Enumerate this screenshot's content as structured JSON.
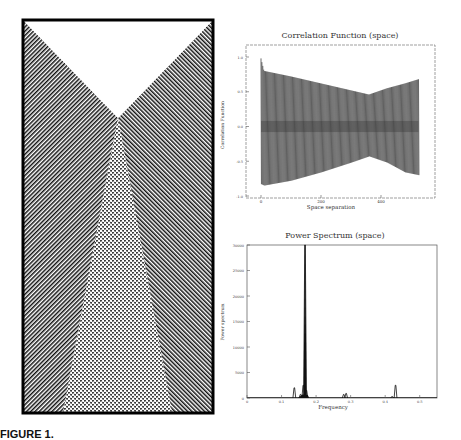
{
  "figure": {
    "caption": "FIGURE 1.",
    "pattern_panel": {
      "description": "Space-time pattern of cellular automaton: diagonal stripes from two sides colliding in a V, with a dotted interference region below the apex"
    }
  },
  "chart_data": [
    {
      "type": "line",
      "title": "Correlation Function (space)",
      "xlabel": "Space separation",
      "ylabel": "Correlation Function",
      "xlim": [
        0,
        580
      ],
      "ylim": [
        -1.0,
        1.0
      ],
      "xticks": [
        "0",
        "200",
        "400"
      ],
      "xtick_values": [
        0,
        200,
        400
      ],
      "yticks": [
        "-1.0",
        "-0.5",
        "0.0",
        "0.5",
        "1.0"
      ],
      "ytick_values": [
        -1.0,
        -0.5,
        0.0,
        0.5,
        1.0
      ],
      "grid": false,
      "series": [
        {
          "name": "correlation",
          "oscillation_period": 6,
          "x_range": [
            0,
            525
          ],
          "envelope_upper": [
            [
              0,
              0.98
            ],
            [
              10,
              0.8
            ],
            [
              100,
              0.72
            ],
            [
              200,
              0.62
            ],
            [
              300,
              0.52
            ],
            [
              360,
              0.46
            ],
            [
              420,
              0.55
            ],
            [
              480,
              0.62
            ],
            [
              525,
              0.68
            ]
          ],
          "envelope_lower": [
            [
              0,
              -0.83
            ],
            [
              10,
              -0.85
            ],
            [
              100,
              -0.78
            ],
            [
              200,
              -0.66
            ],
            [
              300,
              -0.52
            ],
            [
              360,
              -0.43
            ],
            [
              420,
              -0.52
            ],
            [
              480,
              -0.66
            ],
            [
              525,
              -0.7
            ]
          ]
        }
      ]
    },
    {
      "type": "line",
      "title": "Power Spectrum (space)",
      "xlabel": "Frequency",
      "ylabel": "Power spectrum",
      "xlim": [
        0,
        0.55
      ],
      "ylim": [
        0,
        30000
      ],
      "xticks": [
        "0",
        "0.1",
        "0.2",
        "0.3",
        "0.4",
        "0.5"
      ],
      "xtick_values": [
        0,
        0.1,
        0.2,
        0.3,
        0.4,
        0.5
      ],
      "yticks": [
        "0",
        "5000",
        "10000",
        "15000",
        "20000",
        "25000",
        "30000"
      ],
      "ytick_values": [
        0,
        5000,
        10000,
        15000,
        20000,
        25000,
        30000
      ],
      "grid": false,
      "series": [
        {
          "name": "power",
          "peaks": [
            {
              "x": 0.137,
              "y": 2000
            },
            {
              "x": 0.155,
              "y": 700
            },
            {
              "x": 0.163,
              "y": 2500
            },
            {
              "x": 0.168,
              "y": 30000
            },
            {
              "x": 0.172,
              "y": 1500
            },
            {
              "x": 0.28,
              "y": 700
            },
            {
              "x": 0.287,
              "y": 900
            },
            {
              "x": 0.42,
              "y": 300
            },
            {
              "x": 0.43,
              "y": 2500
            }
          ]
        }
      ]
    }
  ]
}
